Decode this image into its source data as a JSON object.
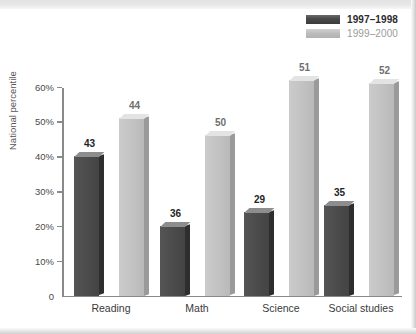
{
  "chart_data": {
    "type": "bar",
    "title": "",
    "subtitle": "",
    "xlabel": "",
    "ylabel": "National percentile",
    "ylim": [
      0,
      60
    ],
    "grid": false,
    "legend_position": "top-right",
    "categories": [
      "Reading",
      "Math",
      "Science",
      "Social studies"
    ],
    "y_ticks": [
      "0",
      "10%",
      "20%",
      "30%",
      "40%",
      "50%",
      "60%"
    ],
    "y_tick_values": [
      0,
      10,
      20,
      30,
      40,
      50,
      60
    ],
    "series": [
      {
        "name": "1997–1998",
        "color": "#4b4b4b",
        "values": [
          40,
          20,
          24,
          26
        ],
        "labels": [
          "43",
          "36",
          "29",
          "35"
        ]
      },
      {
        "name": "1999–2000",
        "color": "#c2c2c2",
        "values": [
          51,
          46,
          62,
          61
        ],
        "labels": [
          "44",
          "50",
          "51",
          "52"
        ]
      }
    ]
  },
  "legend": {
    "items": [
      {
        "label": "1997–1998",
        "swatch": "dark"
      },
      {
        "label": "1999–2000",
        "swatch": "light"
      }
    ]
  },
  "axis": {
    "y_title": "National percentile"
  }
}
